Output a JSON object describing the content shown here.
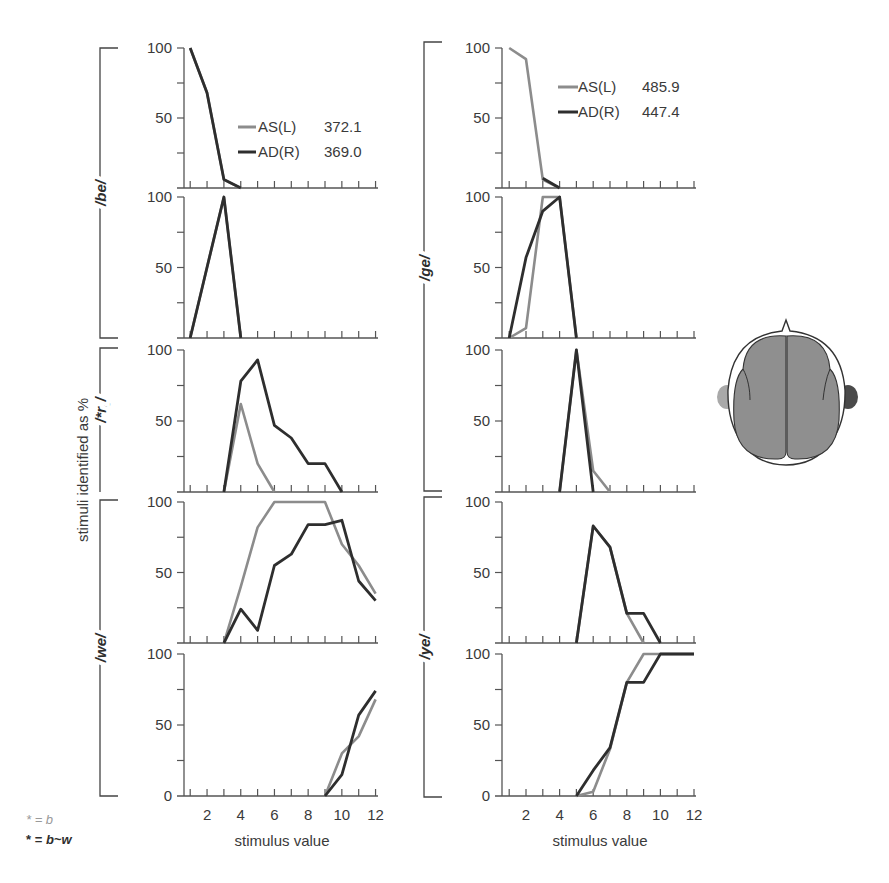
{
  "colors": {
    "as_left": "#8c8c8c",
    "ad_right": "#2e2e2e",
    "axis": "#555555",
    "brain_fill": "#8f8f8f",
    "ear_left": "#a9a9a9",
    "ear_right": "#4a4a4a"
  },
  "labels": {
    "ylabel": "stimuli identified as %",
    "xlabel_left": "stimulus value",
    "xlabel_right": "stimulus value",
    "footnote_gray": "* = b",
    "footnote_dark": "* = b~w",
    "group_left": [
      "/be/",
      "/*re/",
      "/we/"
    ],
    "group_right": [
      "/ge/",
      "/ye/"
    ]
  },
  "legend_left": {
    "as": {
      "name": "AS(L)",
      "value": "372.1"
    },
    "ad": {
      "name": "AD(R)",
      "value": "369.0"
    }
  },
  "legend_right": {
    "as": {
      "name": "AS(L)",
      "value": "485.9"
    },
    "ad": {
      "name": "AD(R)",
      "value": "447.4"
    }
  },
  "chart_data": [
    {
      "type": "line",
      "title": "Left column (AS(L) 372.1 / AD(R) 369.0)",
      "xlabel": "stimulus value",
      "ylabel": "stimuli identified as %",
      "x": [
        1,
        2,
        3,
        4,
        5,
        6,
        7,
        8,
        9,
        10,
        11,
        12
      ],
      "xticks": [
        2,
        4,
        6,
        8,
        10,
        12
      ],
      "ylim": [
        0,
        100
      ],
      "yticks": [
        0,
        50,
        100
      ],
      "legend": [
        "AS(L) 372.1",
        "AD(R) 369.0"
      ],
      "panels": [
        {
          "group": "/be/",
          "series": [
            {
              "name": "AS(L)",
              "values": [
                100,
                68,
                6,
                0,
                null,
                null,
                null,
                null,
                null,
                null,
                null,
                null
              ]
            },
            {
              "name": "AD(R)",
              "values": [
                100,
                68,
                6,
                0,
                null,
                null,
                null,
                null,
                null,
                null,
                null,
                null
              ]
            }
          ]
        },
        {
          "group": "/be/",
          "series": [
            {
              "name": "AS(L)",
              "values": [
                0,
                50,
                100,
                0,
                null,
                null,
                null,
                null,
                null,
                null,
                null,
                null
              ]
            },
            {
              "name": "AD(R)",
              "values": [
                0,
                50,
                100,
                0,
                null,
                null,
                null,
                null,
                null,
                null,
                null,
                null
              ]
            }
          ]
        },
        {
          "group": "/*re/",
          "series": [
            {
              "name": "AS(L)",
              "values": [
                null,
                null,
                0,
                62,
                20,
                0,
                null,
                null,
                null,
                null,
                null,
                null
              ]
            },
            {
              "name": "AD(R)",
              "values": [
                null,
                null,
                0,
                78,
                93,
                47,
                38,
                20,
                20,
                0,
                null,
                null
              ]
            }
          ]
        },
        {
          "group": "/we/",
          "series": [
            {
              "name": "AS(L)",
              "values": [
                null,
                null,
                0,
                40,
                82,
                100,
                100,
                100,
                100,
                70,
                55,
                35
              ]
            },
            {
              "name": "AD(R)",
              "values": [
                null,
                null,
                0,
                24,
                9,
                55,
                63,
                84,
                84,
                87,
                44,
                30
              ]
            }
          ]
        },
        {
          "group": "/we/",
          "series": [
            {
              "name": "AS(L)",
              "values": [
                null,
                null,
                null,
                null,
                null,
                null,
                null,
                null,
                0,
                30,
                42,
                68
              ]
            },
            {
              "name": "AD(R)",
              "values": [
                null,
                null,
                null,
                null,
                null,
                null,
                null,
                null,
                0,
                15,
                57,
                74
              ]
            }
          ]
        }
      ]
    },
    {
      "type": "line",
      "title": "Right column (AS(L) 485.9 / AD(R) 447.4)",
      "xlabel": "stimulus value",
      "ylabel": "stimuli identified as %",
      "x": [
        1,
        2,
        3,
        4,
        5,
        6,
        7,
        8,
        9,
        10,
        11,
        12
      ],
      "xticks": [
        2,
        4,
        6,
        8,
        10,
        12
      ],
      "ylim": [
        0,
        100
      ],
      "yticks": [
        0,
        50,
        100
      ],
      "legend": [
        "AS(L) 485.9",
        "AD(R) 447.4"
      ],
      "panels": [
        {
          "group": "/ge/",
          "series": [
            {
              "name": "AS(L)",
              "values": [
                100,
                92,
                6,
                0,
                null,
                null,
                null,
                null,
                null,
                null,
                null,
                null
              ]
            },
            {
              "name": "AD(R)",
              "values": [
                100,
                null,
                7,
                0,
                null,
                null,
                null,
                null,
                null,
                null,
                null,
                null
              ]
            }
          ]
        },
        {
          "group": "/ge/",
          "series": [
            {
              "name": "AS(L)",
              "values": [
                0,
                7,
                100,
                100,
                0,
                null,
                null,
                null,
                null,
                null,
                null,
                null
              ]
            },
            {
              "name": "AD(R)",
              "values": [
                0,
                57,
                90,
                100,
                0,
                null,
                null,
                null,
                null,
                null,
                null,
                null
              ]
            }
          ]
        },
        {
          "group": "/ge/",
          "series": [
            {
              "name": "AS(L)",
              "values": [
                null,
                null,
                null,
                0,
                100,
                15,
                0,
                null,
                null,
                null,
                null,
                null
              ]
            },
            {
              "name": "AD(R)",
              "values": [
                null,
                null,
                null,
                0,
                100,
                0,
                null,
                null,
                null,
                null,
                null,
                null
              ]
            }
          ]
        },
        {
          "group": "/ye/",
          "series": [
            {
              "name": "AS(L)",
              "values": [
                null,
                null,
                null,
                null,
                0,
                83,
                68,
                21,
                0,
                null,
                null,
                null
              ]
            },
            {
              "name": "AD(R)",
              "values": [
                null,
                null,
                null,
                null,
                0,
                83,
                68,
                21,
                21,
                0,
                null,
                null
              ]
            }
          ]
        },
        {
          "group": "/ye/",
          "series": [
            {
              "name": "AS(L)",
              "values": [
                null,
                null,
                null,
                null,
                0,
                3,
                33,
                80,
                100,
                100,
                100,
                100
              ]
            },
            {
              "name": "AD(R)",
              "values": [
                null,
                null,
                null,
                null,
                0,
                18,
                34,
                80,
                80,
                100,
                100,
                100
              ]
            }
          ]
        }
      ]
    }
  ]
}
